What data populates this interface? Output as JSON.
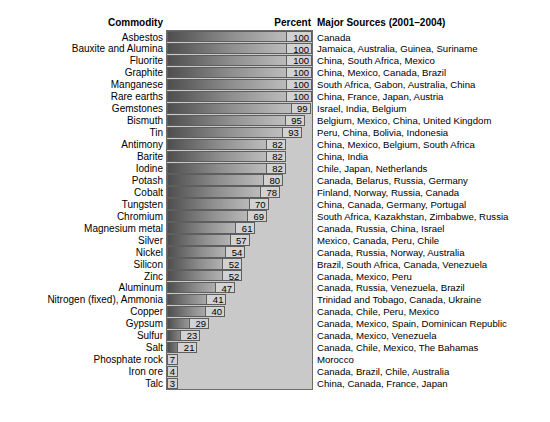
{
  "header": {
    "commodity": "Commodity",
    "percent": "Percent",
    "sources": "Major Sources (2001–2004)"
  },
  "axis": {
    "xmin": 0,
    "xmax": 100
  },
  "chart_data": {
    "type": "bar",
    "orientation": "horizontal",
    "title": "",
    "xlabel": "Percent",
    "ylabel": "Commodity",
    "xlim": [
      0,
      100
    ],
    "grid": false,
    "legend": "none",
    "categories": [
      "Asbestos",
      "Bauxite and Alumina",
      "Fluorite",
      "Graphite",
      "Manganese",
      "Rare earths",
      "Gemstones",
      "Bismuth",
      "Tin",
      "Antimony",
      "Barite",
      "Iodine",
      "Potash",
      "Cobalt",
      "Tungsten",
      "Chromium",
      "Magnesium metal",
      "Silver",
      "Nickel",
      "Silicon",
      "Zinc",
      "Aluminum",
      "Nitrogen (fixed), Ammonia",
      "Copper",
      "Gypsum",
      "Sulfur",
      "Salt",
      "Phosphate rock",
      "Iron ore",
      "Talc"
    ],
    "values": [
      100,
      100,
      100,
      100,
      100,
      100,
      99,
      95,
      93,
      82,
      82,
      82,
      80,
      78,
      70,
      69,
      61,
      57,
      54,
      52,
      52,
      47,
      41,
      40,
      29,
      23,
      21,
      7,
      4,
      3
    ],
    "annotations": [
      "Canada",
      "Jamaica, Australia, Guinea, Suriname",
      "China, South Africa, Mexico",
      "China, Mexico, Canada, Brazil",
      "South Africa, Gabon, Australia, China",
      "China,  France, Japan, Austria",
      "Israel, India, Belgium",
      "Belgium, Mexico, China, United Kingdom",
      "Peru, China, Bolivia, Indonesia",
      "China, Mexico, Belgium, South Africa",
      "China, India",
      "Chile, Japan, Netherlands",
      "Canada, Belarus, Russia, Germany",
      "Finland, Norway, Russia, Canada",
      "China, Canada, Germany, Portugal",
      "South Africa, Kazakhstan, Zimbabwe, Russia",
      "Canada, Russia, China, Israel",
      "Mexico, Canada, Peru, Chile",
      "Canada, Russia, Norway, Australia",
      "Brazil, South Africa, Canada, Venezuela",
      "Canada, Mexico, Peru",
      "Canada, Russia, Venezuela, Brazil",
      "Trinidad and Tobago, Canada, Ukraine",
      "Canada, Chile, Peru, Mexico",
      "Canada, Mexico, Spain, Dominican Republic",
      "Canada, Mexico, Venezuela",
      "Canada, Chile, Mexico, The Bahamas",
      "Morocco",
      "Canada, Brazil, Chile, Australia",
      "China, Canada, France, Japan"
    ]
  },
  "colors": {
    "panel_background": "#c9c9c9",
    "panel_border": "#6d6d6d",
    "bar_gradient_dark": "#4e4e4e",
    "bar_gradient_light": "#c6c6c6",
    "value_box_fill": "#d2d2d2",
    "text": "#000000"
  }
}
